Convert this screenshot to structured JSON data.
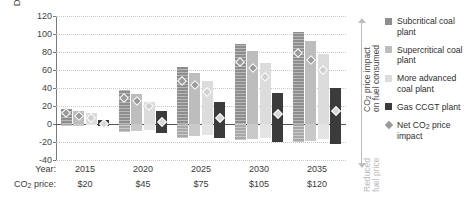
{
  "chart_data": {
    "type": "bar",
    "title": "",
    "ylabel": "Dollars per MWh",
    "xlabel": "",
    "ylim": [
      -40,
      120
    ],
    "yticks": [
      -40,
      -20,
      0,
      20,
      40,
      60,
      80,
      100,
      120
    ],
    "grid": true,
    "categories": [
      "2015",
      "2020",
      "2025",
      "2030",
      "2035"
    ],
    "row_labels": {
      "year": "Year:",
      "co2_price": "CO2 price:",
      "co2_price_pre": "CO",
      "co2_price_sub": "2",
      "co2_price_post": " price:"
    },
    "co2_prices": [
      "$20",
      "$45",
      "$75",
      "$105",
      "$120"
    ],
    "series": [
      {
        "name": "Subcritical coal plant",
        "key": "sub",
        "color": "#8e8e8e",
        "values": [
          17,
          38,
          63,
          89,
          102
        ],
        "negative_values": [
          -2,
          -9,
          -15,
          -18,
          -20
        ],
        "net_impact": [
          16,
          33,
          52,
          73,
          83
        ]
      },
      {
        "name": "Supercritical coal plant",
        "key": "sup",
        "color": "#bdbdbd",
        "values": [
          14,
          33,
          57,
          81,
          92
        ],
        "negative_values": [
          -2,
          -8,
          -13,
          -17,
          -19
        ],
        "net_impact": [
          13,
          29,
          47,
          66,
          75
        ]
      },
      {
        "name": "More advanced coal plant",
        "key": "adv",
        "color": "#dcdcdc",
        "values": [
          12,
          24,
          48,
          68,
          78
        ],
        "negative_values": [
          -1,
          -7,
          -12,
          -15,
          -17
        ],
        "net_impact": [
          11,
          24,
          40,
          56,
          64
        ]
      },
      {
        "name": "Gas CCGT plant",
        "key": "gas",
        "color": "#3b3b3b",
        "values": [
          5,
          14,
          25,
          34,
          40
        ],
        "negative_values": [
          -2,
          -10,
          -16,
          -20,
          -22
        ],
        "net_impact": [
          4,
          6,
          11,
          15,
          18
        ]
      }
    ],
    "marker_series": {
      "name": "Net CO2 price impact",
      "marker": "diamond",
      "color": "#9a9a9a"
    },
    "right_axis": {
      "upper_label": "CO2 price impact on fuel consumed",
      "upper_label_pre": "CO",
      "upper_label_sub": "2",
      "upper_label_post": " price impact",
      "upper_label_line2": "on fuel consumed",
      "lower_label_line1": "Reduced",
      "lower_label_line2": "fuel price"
    },
    "legend": {
      "position": "right",
      "entries": [
        {
          "label": "Subcritical coal plant",
          "swatch": "sw-sub",
          "type": "square"
        },
        {
          "label": "Supercritical coal plant",
          "swatch": "sw-sup",
          "type": "square"
        },
        {
          "label": "More advanced coal plant",
          "swatch": "sw-adv",
          "type": "square"
        },
        {
          "label": "Gas CCGT plant",
          "swatch": "sw-gas",
          "type": "square"
        },
        {
          "label": "Net CO2 price impact",
          "swatch": "sw-dia",
          "type": "diamond",
          "label_pre": "Net CO",
          "label_sub": "2",
          "label_post": " price",
          "label_line2": "impact"
        }
      ]
    }
  }
}
